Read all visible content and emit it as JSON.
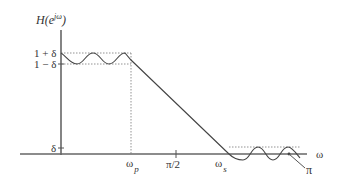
{
  "diagram": {
    "y_axis_label": "H(e",
    "y_axis_label_sup": "jω",
    "y_axis_label_close": ")",
    "x_axis_label": "ω",
    "y_ticks": {
      "upper_passband": "1 + δ",
      "lower_passband": "1 − δ",
      "stopband": "δ"
    },
    "x_ticks": {
      "passband_edge": "ω",
      "passband_edge_sub": "p",
      "midpoint": "π/2",
      "stopband_edge": "ω",
      "stopband_edge_sub": "s",
      "end": "π"
    },
    "colors": {
      "axis": "#666666",
      "curve": "#444444",
      "guide": "#777777",
      "text": "#333333"
    }
  }
}
